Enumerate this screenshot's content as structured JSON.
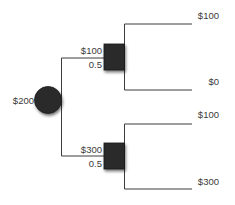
{
  "diagram": {
    "type": "decision-tree",
    "colors": {
      "line": "#3c3c3c",
      "node_fill": "#2b2b2b",
      "text": "#3a3a3a",
      "background": "#ffffff"
    },
    "root": {
      "shape": "circle",
      "value_label": "$200"
    },
    "branches": [
      {
        "chance_node": {
          "shape": "square",
          "value_label": "$100",
          "probability_label": "0.5"
        },
        "outcomes": [
          {
            "label": "$100"
          },
          {
            "label": "$0"
          }
        ]
      },
      {
        "chance_node": {
          "shape": "square",
          "value_label": "$300",
          "probability_label": "0.5"
        },
        "outcomes": [
          {
            "label": "$100"
          },
          {
            "label": "$300"
          }
        ]
      }
    ]
  }
}
